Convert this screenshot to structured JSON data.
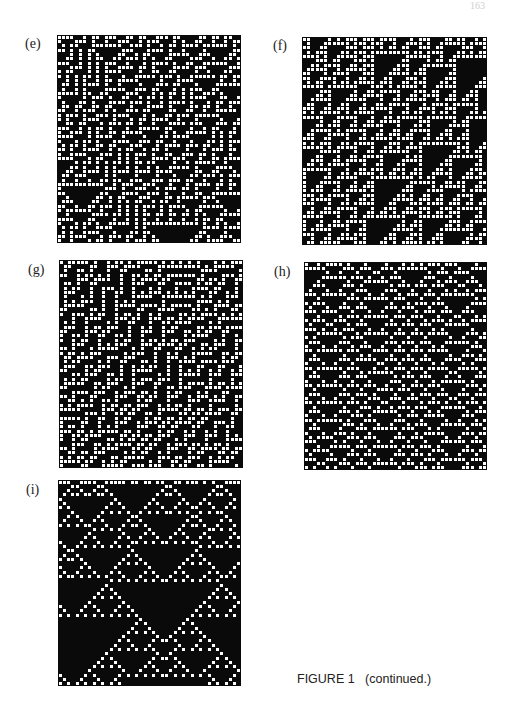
{
  "page": {
    "number": "163"
  },
  "figure": {
    "caption": "FIGURE 1   (continued.)",
    "panels": [
      {
        "id": "e",
        "label": "(e)",
        "rule": 30,
        "seed": 11,
        "cols": 43,
        "rows": 48,
        "x": 57,
        "y": 35,
        "w": 184,
        "h": 208,
        "label_x": 25,
        "label_y": 36
      },
      {
        "id": "f",
        "label": "(f)",
        "rule": 110,
        "seed": 23,
        "cols": 43,
        "rows": 48,
        "x": 302,
        "y": 37,
        "w": 185,
        "h": 208,
        "label_x": 273,
        "label_y": 38
      },
      {
        "id": "g",
        "label": "(g)",
        "rule": 45,
        "seed": 37,
        "cols": 43,
        "rows": 48,
        "x": 59,
        "y": 260,
        "w": 184,
        "h": 208,
        "label_x": 28,
        "label_y": 262
      },
      {
        "id": "h",
        "label": "(h)",
        "rule": 54,
        "seed": 41,
        "cols": 43,
        "rows": 48,
        "x": 304,
        "y": 262,
        "w": 183,
        "h": 208,
        "label_x": 274,
        "label_y": 264
      },
      {
        "id": "i",
        "label": "(i)",
        "rule": 18,
        "seed": 53,
        "cols": 43,
        "rows": 48,
        "x": 58,
        "y": 480,
        "w": 183,
        "h": 206,
        "label_x": 26,
        "label_y": 482
      }
    ]
  },
  "colors": {
    "cell_on": "#ffffff",
    "cell_off": "#0a0a0a"
  }
}
